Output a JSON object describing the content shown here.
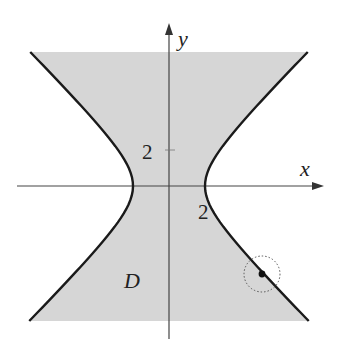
{
  "figure": {
    "type": "region-diagram",
    "colors": {
      "region_fill": "#d6d6d6",
      "curve": "#1a1a1a",
      "axis": "#444444",
      "background": "#ffffff"
    },
    "axes": {
      "x_label": "x",
      "y_label": "y"
    },
    "ticks": {
      "y_tick_label": "2",
      "x_vertex_label": "2"
    },
    "region_label": "D",
    "curve_equation": "x^2 - y^2 = 4",
    "marker": {
      "description": "point on boundary with dotted neighborhood circle"
    }
  }
}
